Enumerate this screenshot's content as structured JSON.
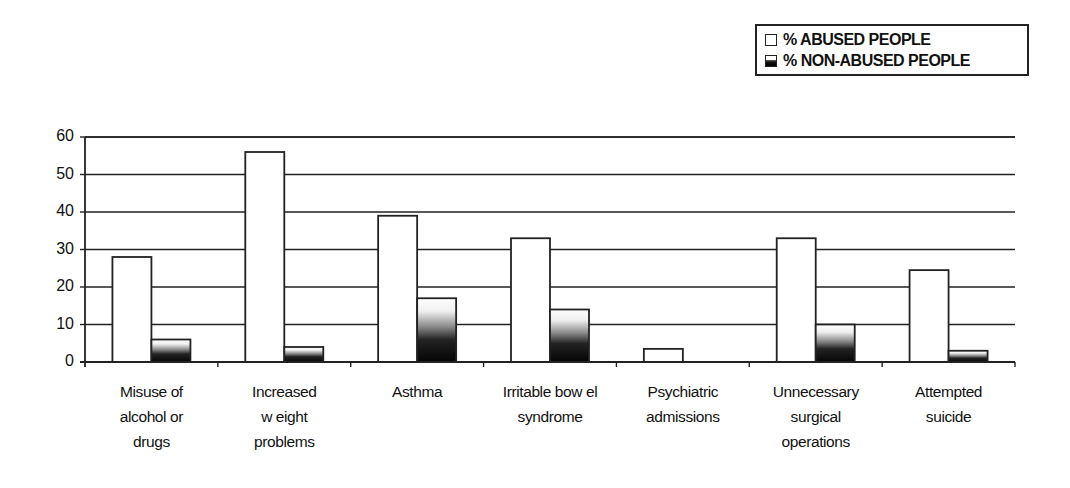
{
  "chart_data": {
    "type": "bar",
    "title": "",
    "xlabel": "",
    "ylabel": "",
    "ylim": [
      0,
      60
    ],
    "yticks": [
      0,
      10,
      20,
      30,
      40,
      50,
      60
    ],
    "grid": true,
    "legend_position": "top-right",
    "categories": [
      "Misuse of alcohol or drugs",
      "Increased weight problems",
      "Asthma",
      "Irritable bowel syndrome",
      "Psychiatric admissions",
      "Unnecessary surgical operations",
      "Attempted suicide"
    ],
    "category_display": [
      "Misuse of\nalcohol or\ndrugs",
      "Increased\nw eight\nproblems",
      "Asthma",
      "Irritable bow el\nsyndrome",
      "Psychiatric\nadmissions",
      "Unnecessary\nsurgical\noperations",
      "Attempted\nsuicide"
    ],
    "series": [
      {
        "name": "% ABUSED PEOPLE",
        "fill": "#ffffff",
        "values": [
          28,
          56,
          39,
          33,
          3.5,
          33,
          24.5
        ]
      },
      {
        "name": "% NON-ABUSED PEOPLE",
        "fill": "gradient-dark",
        "values": [
          6,
          4,
          17,
          14,
          0,
          10,
          3
        ]
      }
    ]
  },
  "legend": {
    "items": [
      {
        "label": "% ABUSED PEOPLE",
        "swatch": "white"
      },
      {
        "label": "% NON-ABUSED PEOPLE",
        "swatch": "dark-gradient"
      }
    ]
  }
}
